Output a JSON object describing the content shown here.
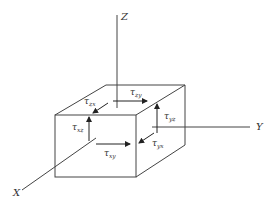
{
  "diagram": {
    "type": "stress-element-3d",
    "colors": {
      "line": "#444444",
      "text": "#333333",
      "background": "#ffffff"
    },
    "axes": {
      "z": {
        "label": "Z"
      },
      "y": {
        "label": "Y"
      },
      "x": {
        "label": "X"
      }
    },
    "stresses": [
      {
        "symbol": "τ",
        "sub": "zy",
        "face": "top",
        "direction": "+y"
      },
      {
        "symbol": "τ",
        "sub": "zx",
        "face": "top",
        "direction": "+x"
      },
      {
        "symbol": "τ",
        "sub": "xz",
        "face": "front",
        "direction": "+z"
      },
      {
        "symbol": "τ",
        "sub": "xy",
        "face": "front",
        "direction": "+y"
      },
      {
        "symbol": "τ",
        "sub": "yz",
        "face": "right",
        "direction": "+z"
      },
      {
        "symbol": "τ",
        "sub": "yx",
        "face": "right",
        "direction": "+x"
      }
    ]
  }
}
